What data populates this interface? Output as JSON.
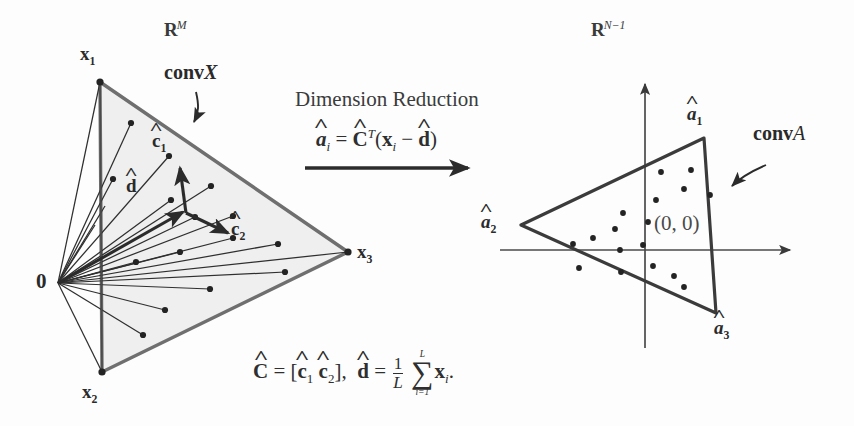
{
  "figure": {
    "caption_present": false,
    "background": "#fdfdfd",
    "ink_color": "#2b2b2b",
    "fill_color": "#f0f0f0",
    "stroke_color": "#6e6e6e"
  },
  "left_panel": {
    "space_label": "R",
    "space_exponent": "M",
    "origin_label": "0",
    "convex_hull_label": "conv",
    "convex_hull_set": "X",
    "vertices": [
      {
        "name": "x",
        "index": "1",
        "x": 100,
        "y": 82
      },
      {
        "name": "x",
        "index": "2",
        "x": 102,
        "y": 372
      },
      {
        "name": "x",
        "index": "3",
        "x": 348,
        "y": 252
      }
    ],
    "origin": {
      "x": 58,
      "y": 283
    },
    "basis_vectors": [
      {
        "name": "c",
        "index": "1",
        "label_x": 155,
        "label_y": 143,
        "tip_x": 182,
        "tip_y": 178
      },
      {
        "name": "c",
        "index": "2",
        "label_x": 222,
        "label_y": 230,
        "tip_x": 213,
        "tip_y": 222
      }
    ],
    "mean_vector": {
      "name": "d",
      "label_x": 130,
      "label_y": 186,
      "tip_x": 180,
      "tip_y": 210
    },
    "data_points": [
      {
        "x": 131,
        "y": 123
      },
      {
        "x": 169,
        "y": 156
      },
      {
        "x": 113,
        "y": 179
      },
      {
        "x": 171,
        "y": 200
      },
      {
        "x": 211,
        "y": 186
      },
      {
        "x": 195,
        "y": 217
      },
      {
        "x": 233,
        "y": 216
      },
      {
        "x": 233,
        "y": 238
      },
      {
        "x": 180,
        "y": 252
      },
      {
        "x": 136,
        "y": 262
      },
      {
        "x": 278,
        "y": 244
      },
      {
        "x": 285,
        "y": 272
      },
      {
        "x": 210,
        "y": 289
      },
      {
        "x": 165,
        "y": 310
      },
      {
        "x": 143,
        "y": 335
      },
      {
        "x": 95,
        "y": 225
      },
      {
        "x": 105,
        "y": 206
      }
    ]
  },
  "center": {
    "title": "Dimension Reduction",
    "formula_alpha": "a",
    "formula_alpha_sub": "i",
    "formula_eq": "=",
    "formula_C": "C",
    "formula_C_sup": "T",
    "formula_open": "(",
    "formula_x": "x",
    "formula_x_sub": "i",
    "formula_minus": "−",
    "formula_d": "d",
    "formula_close": ")",
    "arrow": "right-arrow"
  },
  "bottom_formula": {
    "C": "C",
    "eq1": "=",
    "bracket_open": "[",
    "c1": "c",
    "c1_sub": "1",
    "c2": "c",
    "c2_sub": "2",
    "bracket_close": "]",
    "comma": ",",
    "d": "d",
    "eq2": "=",
    "frac_num": "1",
    "frac_den": "L",
    "sigma": "∑",
    "sigma_upper": "L",
    "sigma_lower": "i=1",
    "x": "x",
    "x_sub": "i",
    "period": "."
  },
  "right_panel": {
    "space_label": "R",
    "space_exponent": "N−1",
    "origin_text": "(0, 0)",
    "convex_hull_label": "conv",
    "convex_hull_set": "A",
    "axis_origin": {
      "x": 645,
      "y": 250
    },
    "vertices": [
      {
        "name": "a",
        "index": "1",
        "x": 704,
        "y": 138
      },
      {
        "name": "a",
        "index": "2",
        "x": 521,
        "y": 225
      },
      {
        "name": "a",
        "index": "3",
        "x": 716,
        "y": 313
      }
    ],
    "data_points": [
      {
        "x": 661,
        "y": 172
      },
      {
        "x": 691,
        "y": 170
      },
      {
        "x": 656,
        "y": 200
      },
      {
        "x": 710,
        "y": 195
      },
      {
        "x": 684,
        "y": 189
      },
      {
        "x": 623,
        "y": 213
      },
      {
        "x": 615,
        "y": 229
      },
      {
        "x": 648,
        "y": 222
      },
      {
        "x": 643,
        "y": 245
      },
      {
        "x": 573,
        "y": 244
      },
      {
        "x": 593,
        "y": 238
      },
      {
        "x": 620,
        "y": 250
      },
      {
        "x": 579,
        "y": 268
      },
      {
        "x": 621,
        "y": 272
      },
      {
        "x": 653,
        "y": 266
      },
      {
        "x": 674,
        "y": 276
      },
      {
        "x": 684,
        "y": 287
      }
    ]
  }
}
